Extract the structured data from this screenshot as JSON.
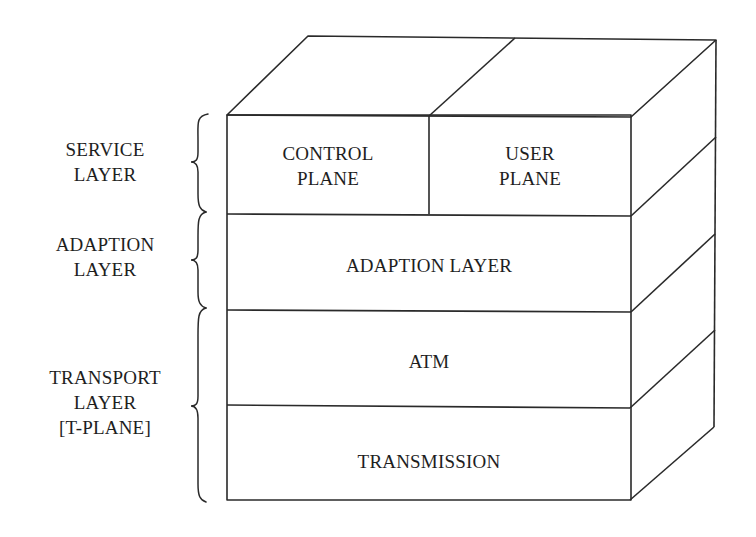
{
  "diagram": {
    "side_labels": {
      "service": "SERVICE\nLAYER",
      "adaption": "ADAPTION\nLAYER",
      "transport": "TRANSPORT\nLAYER\n[T-PLANE]"
    },
    "planes": {
      "control": "CONTROL\nPLANE",
      "user": "USER\nPLANE"
    },
    "layers": {
      "adaption": "ADAPTION LAYER",
      "atm": "ATM",
      "transmission": "TRANSMISSION"
    },
    "colors": {
      "line": "#2a2a2a",
      "text": "#1e1e1e",
      "background": "#ffffff"
    }
  }
}
